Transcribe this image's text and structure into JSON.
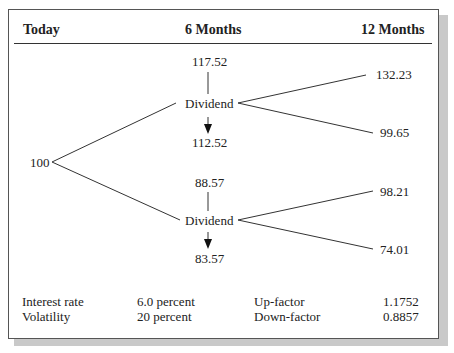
{
  "headers": {
    "today": "Today",
    "six_months": "6 Months",
    "twelve_months": "12 Months"
  },
  "tree": {
    "root": "100",
    "upper": {
      "pre_dividend": "117.52",
      "label": "Dividend",
      "post_dividend": "112.52",
      "up": "132.23",
      "down": "99.65"
    },
    "lower": {
      "pre_dividend": "88.57",
      "label": "Dividend",
      "post_dividend": "83.57",
      "up": "98.21",
      "down": "74.01"
    }
  },
  "parameters": {
    "interest_rate_label": "Interest rate",
    "interest_rate_value": "6.0 percent",
    "volatility_label": "Volatility",
    "volatility_value": "20 percent",
    "up_factor_label": "Up-factor",
    "up_factor_value": "1.1752",
    "down_factor_label": "Down-factor",
    "down_factor_value": "0.8857"
  }
}
